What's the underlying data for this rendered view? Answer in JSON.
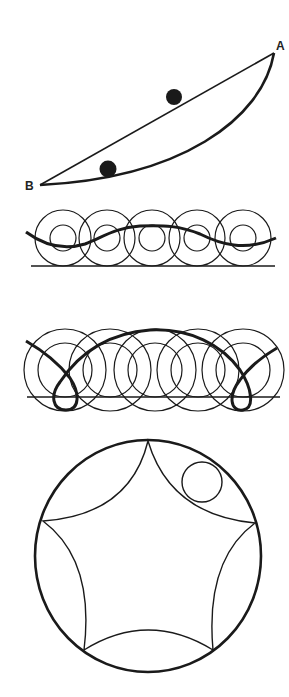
{
  "figures": {
    "brachistochrone": {
      "label_a": "A",
      "label_b": "B",
      "point_a": [
        274,
        53
      ],
      "point_b": [
        40,
        185
      ],
      "balls": [
        [
          174,
          97
        ],
        [
          108,
          169
        ]
      ]
    },
    "curtate_cycloid": {
      "baseline_y": 266,
      "circle_centers_x": [
        63,
        107,
        152,
        197,
        243
      ],
      "outer_radius": 28,
      "inner_radius": 13
    },
    "prolate_cycloid": {
      "baseline_y": 397,
      "circle_centers_x": [
        65,
        110,
        155,
        198,
        243
      ],
      "outer_radius": 42,
      "inner_radius": 28
    },
    "hypocycloid": {
      "center": [
        148,
        556
      ],
      "radius": 114,
      "cusps": 5,
      "rolling_circle_center": [
        202,
        482
      ],
      "rolling_circle_radius": 20
    }
  },
  "colors": {
    "ink": "#1a1a1a",
    "background": "#ffffff"
  }
}
